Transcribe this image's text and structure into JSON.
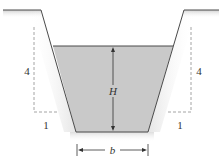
{
  "diagram": {
    "type": "trapezoidal-channel-cross-section",
    "labels": {
      "depth": "H",
      "bottom_width": "b",
      "left_slope_rise": "4",
      "left_slope_run": "1",
      "right_slope_rise": "4",
      "right_slope_run": "1"
    },
    "side_slope": "4:1 (vertical:horizontal)",
    "colors": {
      "water_fill": "#c9c9c9",
      "line": "#4a4a4a",
      "dashed": "#9a9a9a",
      "ground_shade": "#d8d8d8"
    }
  }
}
